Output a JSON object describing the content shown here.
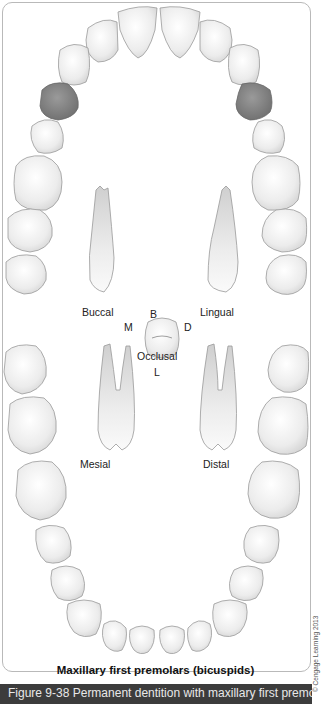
{
  "figure": {
    "title": "Maxillary first premolars (bicuspids)",
    "caption": "Figure 9-38 Permanent dentition with maxillary first premolars (bicuspids) highlighted",
    "credit": "© Cengage Learning 2013"
  },
  "views": {
    "buccal": "Buccal",
    "lingual": "Lingual",
    "occlusal": "Occlusal",
    "mesial": "Mesial",
    "distal": "Distal"
  },
  "orientation": {
    "buccal": "B",
    "lingual": "L",
    "mesial": "M",
    "distal": "D"
  },
  "colors": {
    "highlight": "#8a8a8a",
    "tooth_fill": "#ececec",
    "tooth_stroke": "#9a9a9a",
    "caption_bg": "#3c3c3c"
  }
}
